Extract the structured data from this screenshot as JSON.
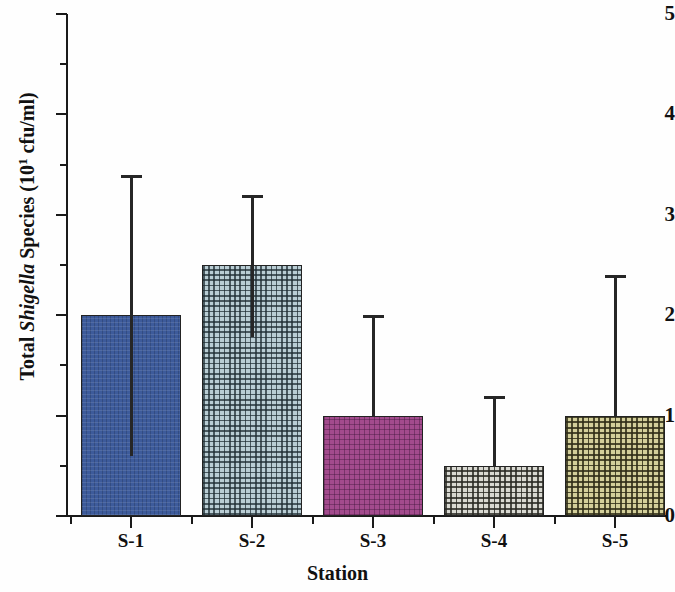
{
  "chart_data": {
    "type": "bar",
    "title": "",
    "xlabel": "Station",
    "ylabel": "Total Shigella Species (10¹ cfu/ml)",
    "ylabel_parts": {
      "prefix": "Total ",
      "italic": "Shigella",
      "middle": " Species (10",
      "exponent": "1",
      "suffix": " cfu/ml)"
    },
    "categories": [
      "S-1",
      "S-2",
      "S-3",
      "S-4",
      "S-5"
    ],
    "values": [
      2.0,
      2.5,
      1.0,
      0.5,
      1.0
    ],
    "error_upper": [
      3.4,
      3.2,
      2.0,
      1.2,
      2.4
    ],
    "error_lower": [
      0.6,
      1.78,
      1.0,
      0.5,
      1.0
    ],
    "ylim": [
      0,
      5
    ],
    "y_major_ticks": [
      0,
      1,
      2,
      3,
      4,
      5
    ],
    "y_tick_labels": [
      "0",
      "1",
      "2",
      "3",
      "4",
      "5"
    ],
    "y_minor_ticks": [
      0.5,
      1.5,
      2.5,
      3.5,
      4.5
    ],
    "grid": false,
    "legend": false,
    "bar_colors": [
      "#3d5b9b",
      "#b9cdd4",
      "#a34b8d",
      "#d9d9d2",
      "#d3cf9a"
    ],
    "bar_edge_color": "#232323",
    "error_bar_color": "#262626",
    "axis_color": "#1a1a1a",
    "background_color": "#ffffff"
  }
}
